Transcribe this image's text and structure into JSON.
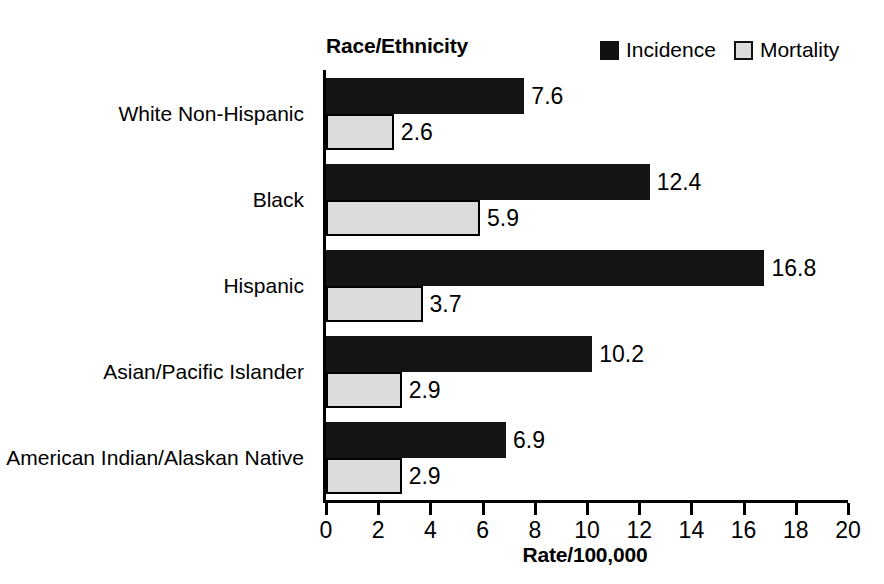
{
  "chart_data": {
    "type": "bar",
    "orientation": "horizontal",
    "title": "",
    "ylabel": "Race/Ethnicity",
    "xlabel": "Rate/100,000",
    "xlim": [
      0,
      20
    ],
    "xticks": [
      0,
      2,
      4,
      6,
      8,
      10,
      12,
      14,
      16,
      18,
      20
    ],
    "xtick_labels": [
      "0",
      "2",
      "4",
      "6",
      "8",
      "10",
      "12",
      "14",
      "16",
      "18",
      "20"
    ],
    "grid": false,
    "legend_position": "top-right",
    "categories": [
      "White Non-Hispanic",
      "Black",
      "Hispanic",
      "Asian/Pacific Islander",
      "American Indian/Alaskan Native"
    ],
    "series": [
      {
        "name": "Incidence",
        "color": "#141414",
        "values": [
          7.6,
          12.4,
          16.8,
          10.2,
          6.9
        ],
        "value_labels": [
          "7.6",
          "12.4",
          "16.8",
          "10.2",
          "6.9"
        ]
      },
      {
        "name": "Mortality",
        "color": "#dcdcdc",
        "edge_color": "#000000",
        "values": [
          2.6,
          5.9,
          3.7,
          2.9,
          2.9
        ],
        "value_labels": [
          "2.6",
          "5.9",
          "3.7",
          "2.9",
          "2.9"
        ]
      }
    ]
  },
  "legend": {
    "items": [
      {
        "label": "Incidence",
        "swatch": "incidence-swatch"
      },
      {
        "label": "Mortality",
        "swatch": "mortality-swatch"
      }
    ]
  }
}
